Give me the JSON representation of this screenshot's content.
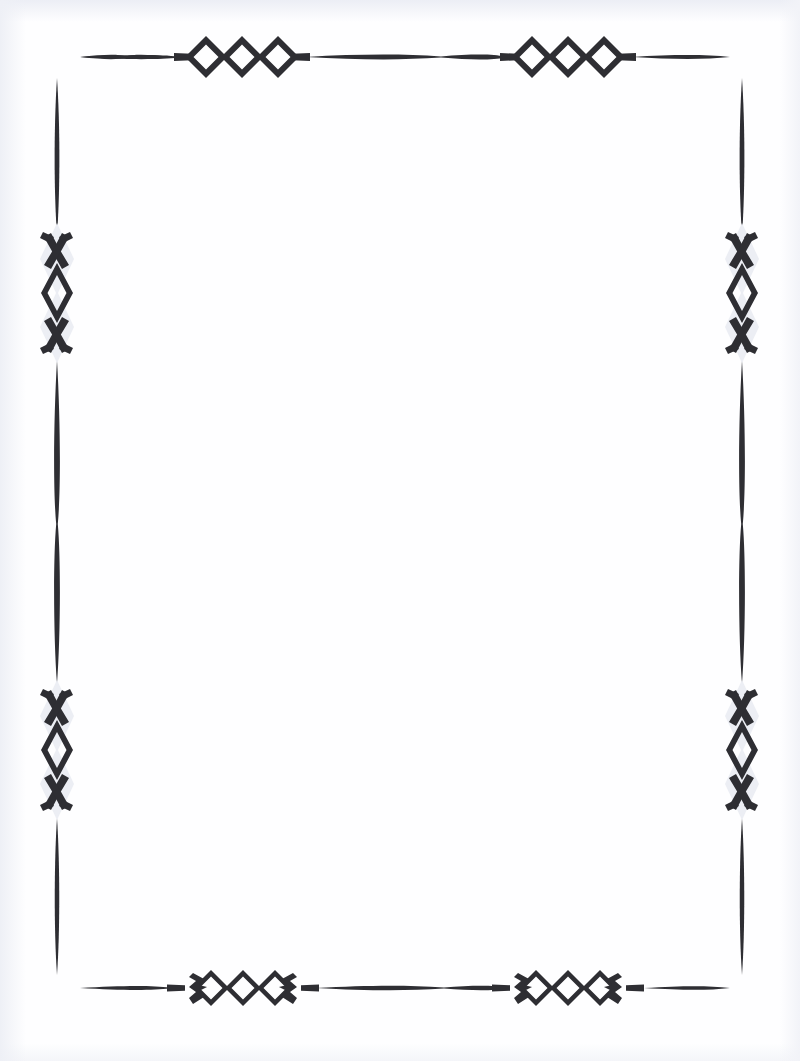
{
  "document": {
    "title": "Decorative Page Border",
    "kind": "ornamental-frame",
    "page_width": 800,
    "page_height": 1061,
    "background_color": "#fdfdff",
    "ink_color": "#2b2b2f",
    "content_text": ""
  },
  "frame": {
    "name": "diamond-chain-border",
    "stroke_color": "#2e2e33",
    "ghost_color": "#eceef4",
    "corners_open": true,
    "rails": {
      "top": {
        "y": 57,
        "x_start": 80,
        "x_end": 730
      },
      "bottom": {
        "y": 988,
        "x_start": 80,
        "x_end": 730
      },
      "left": {
        "x": 57,
        "y_start": 78,
        "y_end": 975
      },
      "right": {
        "x": 742,
        "y_start": 78,
        "y_end": 975
      }
    },
    "ornaments": {
      "top": [
        {
          "name": "triple-diamond",
          "cx": 242,
          "cy": 57,
          "style": "bold-open-diamond"
        },
        {
          "name": "triple-diamond",
          "cx": 568,
          "cy": 57,
          "style": "bold-open-diamond"
        }
      ],
      "bottom": [
        {
          "name": "triple-diamond-hooked",
          "cx": 243,
          "cy": 988,
          "style": "hooked-diamond"
        },
        {
          "name": "triple-diamond-hooked",
          "cx": 568,
          "cy": 988,
          "style": "hooked-diamond"
        }
      ],
      "left": [
        {
          "name": "x-chain",
          "cx": 57,
          "cy": 293,
          "style": "vertical-x-chain"
        },
        {
          "name": "x-chain",
          "cx": 57,
          "cy": 750,
          "style": "vertical-x-chain"
        }
      ],
      "right": [
        {
          "name": "x-chain",
          "cx": 742,
          "cy": 293,
          "style": "vertical-x-chain"
        },
        {
          "name": "x-chain",
          "cx": 742,
          "cy": 750,
          "style": "vertical-x-chain"
        }
      ]
    }
  },
  "labels": {
    "page_region": "page",
    "content_region": "blank-content-area",
    "border_region": "decorative-border"
  }
}
